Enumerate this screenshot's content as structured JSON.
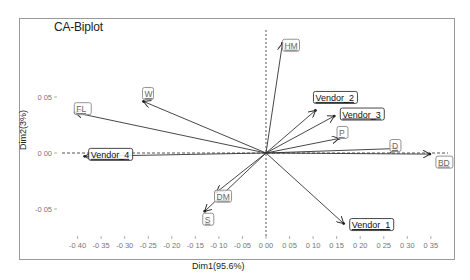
{
  "chart_data": {
    "type": "scatter",
    "subtype": "correspondence-analysis-biplot",
    "title": "CA-Biplot",
    "xlabel": "Dim1(95.6%)",
    "ylabel": "Dim2(3%)",
    "xlim": [
      -0.42,
      0.37
    ],
    "ylim": [
      -0.085,
      0.115
    ],
    "x_ticks": [
      "-0.40",
      "-0.35",
      "-0.30",
      "-0.25",
      "-0.20",
      "-0.15",
      "-0.10",
      "-0.05",
      "0.00",
      "0.05",
      "0.10",
      "0.15",
      "0.20",
      "0.25",
      "0.30",
      "0.35"
    ],
    "y_ticks": [
      "0.05",
      "0.00",
      "-0.05"
    ],
    "reference_lines": {
      "x": 0,
      "y": 0,
      "style": "dashed"
    },
    "grid": false,
    "series": [
      {
        "name": "rows",
        "points": [
          {
            "label": "Vendor_1",
            "x": 0.165,
            "y": -0.063
          },
          {
            "label": "Vendor_2",
            "x": 0.105,
            "y": 0.038
          },
          {
            "label": "Vendor_3",
            "x": 0.145,
            "y": 0.033
          },
          {
            "label": "Vendor_4",
            "x": -0.385,
            "y": -0.003
          }
        ]
      },
      {
        "name": "columns",
        "points": [
          {
            "label": "HM",
            "x": 0.035,
            "y": 0.098
          },
          {
            "label": "FL",
            "x": -0.405,
            "y": 0.036
          },
          {
            "label": "W",
            "x": -0.26,
            "y": 0.046
          },
          {
            "label": "P",
            "x": 0.155,
            "y": 0.013
          },
          {
            "label": "D",
            "x": 0.278,
            "y": 0.004
          },
          {
            "label": "BD",
            "x": 0.348,
            "y": -0.001
          },
          {
            "label": "DM",
            "x": -0.105,
            "y": -0.035
          },
          {
            "label": "S",
            "x": -0.13,
            "y": -0.052
          }
        ]
      }
    ]
  },
  "labels": {
    "title": "CA-Biplot",
    "xlabel": "Dim1(95.6%)",
    "ylabel": "Dim2(3%)"
  }
}
